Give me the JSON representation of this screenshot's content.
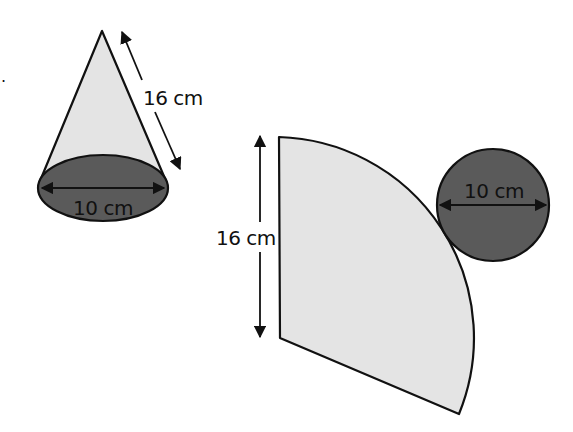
{
  "figure": {
    "question_marker": ".",
    "colors": {
      "cone_surface": "#e4e4e4",
      "base_disc": "#5a5a5a",
      "stroke": "#111111",
      "background": "#ffffff"
    },
    "cone": {
      "slant_height_label": "16 cm",
      "base_diameter_label": "10 cm"
    },
    "net": {
      "sector_radius_label": "16 cm",
      "circle_diameter_label": "10 cm"
    }
  }
}
